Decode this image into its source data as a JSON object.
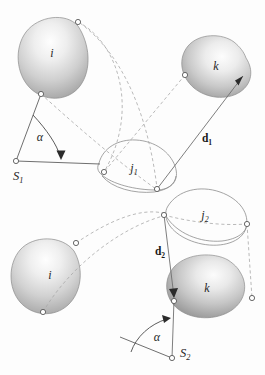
{
  "figure": {
    "background_color": "#fdfdfd",
    "width": 265,
    "height": 375,
    "body_fill_light": "#fcfcfc",
    "body_fill_dark": "#8e8e8e",
    "outline_color": "#8d8d8d",
    "dashed_color": "#a8a8a8",
    "solid_link_color": "#6f6f6f",
    "marker_fill": "#ffffff",
    "marker_stroke": "#585858",
    "text_color": "#262626"
  },
  "panels": [
    {
      "id": "upper",
      "name": "upper-configuration",
      "bodies": [
        {
          "id": "i1",
          "label": "i",
          "shaded": true,
          "name": "body-i-upper"
        },
        {
          "id": "k1",
          "label": "k",
          "shaded": true,
          "name": "body-k-upper"
        },
        {
          "id": "j1",
          "label": "j",
          "subscript": "1",
          "shaded": false,
          "name": "body-j1"
        }
      ],
      "vector": {
        "label": "d",
        "subscript": "1",
        "name": "vector-d1"
      },
      "angle": {
        "label": "α",
        "name": "angle-alpha-upper"
      },
      "frame": {
        "label": "S",
        "subscript": "1",
        "name": "frame-s1"
      }
    },
    {
      "id": "lower",
      "name": "lower-configuration",
      "bodies": [
        {
          "id": "i2",
          "label": "i",
          "shaded": true,
          "name": "body-i-lower"
        },
        {
          "id": "k2",
          "label": "k",
          "shaded": true,
          "name": "body-k-lower"
        },
        {
          "id": "j2",
          "label": "j",
          "subscript": "2",
          "shaded": false,
          "name": "body-j2"
        }
      ],
      "vector": {
        "label": "d",
        "subscript": "2",
        "name": "vector-d2"
      },
      "angle": {
        "label": "α",
        "name": "angle-alpha-lower"
      },
      "frame": {
        "label": "S",
        "subscript": "2",
        "name": "frame-s2"
      }
    }
  ],
  "labels": {
    "i_upper": "i",
    "k_upper": "k",
    "j1_base": "j",
    "j1_sub": "1",
    "d1_base": "d",
    "d1_sub": "1",
    "alpha_upper": "α",
    "s1_base": "S",
    "s1_sub": "1",
    "i_lower": "i",
    "k_lower": "k",
    "j2_base": "j",
    "j2_sub": "2",
    "d2_base": "d",
    "d2_sub": "2",
    "alpha_lower": "α",
    "s2_base": "S",
    "s2_sub": "2"
  }
}
